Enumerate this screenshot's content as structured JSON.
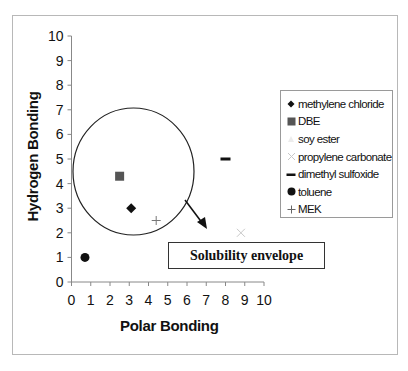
{
  "chart_data": {
    "type": "scatter",
    "title": "",
    "xlabel": "Polar Bonding",
    "ylabel": "Hydrogen Bonding",
    "xlim": [
      0,
      10
    ],
    "ylim": [
      0,
      10
    ],
    "x_ticks": [
      "0",
      "1",
      "2",
      "3",
      "4",
      "5",
      "6",
      "7",
      "8",
      "9",
      "10"
    ],
    "y_ticks": [
      "0",
      "1",
      "2",
      "3",
      "4",
      "5",
      "6",
      "7",
      "8",
      "9",
      "10"
    ],
    "grid": false,
    "legend_position": "right",
    "series": [
      {
        "name": "methylene chloride",
        "marker": "diamond",
        "color": "#111111",
        "points": [
          {
            "x": 3.1,
            "y": 3.0
          }
        ]
      },
      {
        "name": "DBE",
        "marker": "square",
        "color": "#555555",
        "points": [
          {
            "x": 2.5,
            "y": 4.3
          }
        ]
      },
      {
        "name": "soy ester",
        "marker": "triangle",
        "color": "#e6e6e6",
        "points": []
      },
      {
        "name": "propylene carbonate",
        "marker": "x",
        "color": "#c8c8c8",
        "points": [
          {
            "x": 8.8,
            "y": 2.0
          }
        ]
      },
      {
        "name": "dimethyl sulfoxide",
        "marker": "dash",
        "color": "#111111",
        "points": [
          {
            "x": 8.0,
            "y": 5.0
          }
        ]
      },
      {
        "name": "toluene",
        "marker": "circle",
        "color": "#111111",
        "points": [
          {
            "x": 0.7,
            "y": 1.0
          }
        ]
      },
      {
        "name": "MEK",
        "marker": "plus",
        "color": "#777777",
        "points": [
          {
            "x": 4.4,
            "y": 2.5
          }
        ]
      }
    ],
    "annotations": [
      {
        "type": "ellipse",
        "label": "Solubility envelope",
        "center": {
          "x": 3.15,
          "y": 4.35
        },
        "rx": 3.15,
        "ry": 2.6
      },
      {
        "type": "textbox",
        "text": "Solubility envelope",
        "arrow_from": {
          "x": 5.9,
          "y": 3.2
        },
        "arrow_to": {
          "x": 7.1,
          "y": 2.2
        }
      }
    ]
  },
  "labels": {
    "x_axis_title": "Polar Bonding",
    "y_axis_title": "Hydrogen Bonding",
    "callout": "Solubility envelope"
  },
  "legend": [
    {
      "label": "methylene chloride",
      "icon": "diamond-icon"
    },
    {
      "label": "DBE",
      "icon": "square-icon"
    },
    {
      "label": "soy ester",
      "icon": "triangle-icon"
    },
    {
      "label": "propylene carbonate",
      "icon": "x-icon"
    },
    {
      "label": "dimethyl sulfoxide",
      "icon": "dash-icon"
    },
    {
      "label": "toluene",
      "icon": "circle-icon"
    },
    {
      "label": "MEK",
      "icon": "plus-icon"
    }
  ]
}
